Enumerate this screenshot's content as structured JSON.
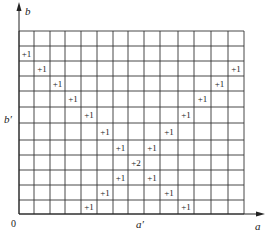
{
  "diagram": {
    "axes": {
      "x_label": "a",
      "y_label": "b",
      "origin_label": "0",
      "x_mark_label": "a′",
      "y_mark_label": "b′"
    },
    "grid": {
      "columns": 14,
      "rows": 12,
      "col_edges": [
        19,
        34,
        50,
        65,
        81,
        97,
        113,
        128,
        144,
        160,
        178,
        194,
        211,
        228,
        244
      ],
      "row_edges": [
        31,
        46,
        61,
        76,
        91,
        107,
        123,
        140,
        155,
        170,
        185,
        200,
        214
      ]
    },
    "cells": [
      {
        "col": 0,
        "row": 1,
        "value": "+1"
      },
      {
        "col": 1,
        "row": 2,
        "value": "+1"
      },
      {
        "col": 2,
        "row": 3,
        "value": "+1"
      },
      {
        "col": 3,
        "row": 4,
        "value": "+1"
      },
      {
        "col": 4,
        "row": 5,
        "value": "+1"
      },
      {
        "col": 5,
        "row": 6,
        "value": "+1"
      },
      {
        "col": 6,
        "row": 7,
        "value": "+1"
      },
      {
        "col": 7,
        "row": 8,
        "value": "+2"
      },
      {
        "col": 6,
        "row": 9,
        "value": "+1"
      },
      {
        "col": 5,
        "row": 10,
        "value": "+1"
      },
      {
        "col": 4,
        "row": 11,
        "value": "+1"
      },
      {
        "col": 8,
        "row": 7,
        "value": "+1"
      },
      {
        "col": 9,
        "row": 6,
        "value": "+1"
      },
      {
        "col": 10,
        "row": 5,
        "value": "+1"
      },
      {
        "col": 11,
        "row": 4,
        "value": "+1"
      },
      {
        "col": 12,
        "row": 3,
        "value": "+1"
      },
      {
        "col": 13,
        "row": 2,
        "value": "+1"
      },
      {
        "col": 8,
        "row": 9,
        "value": "+1"
      },
      {
        "col": 9,
        "row": 10,
        "value": "+1"
      },
      {
        "col": 10,
        "row": 11,
        "value": "+1"
      }
    ]
  }
}
